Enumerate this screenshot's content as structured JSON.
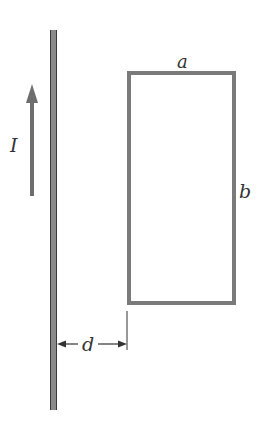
{
  "diagram": {
    "colors": {
      "wire": "#6b6b6b",
      "wire_edge": "#3a3a3a",
      "loop": "#7a7a7a",
      "arrow": "#6e6e6e",
      "text": "#333333"
    },
    "labels": {
      "current": "I",
      "loop_width": "a",
      "loop_height": "b",
      "distance": "d"
    },
    "elements": {
      "wire": {
        "x": 50,
        "y1": 30,
        "y2": 410,
        "width": 7
      },
      "current_arrow": {
        "x": 32,
        "y_tail": 196,
        "y_head": 84,
        "direction": "up"
      },
      "loop": {
        "x": 127,
        "y": 72,
        "width": 107,
        "height": 233
      },
      "distance_marker": {
        "x_from": 57,
        "x_to": 127,
        "y": 344
      }
    }
  }
}
